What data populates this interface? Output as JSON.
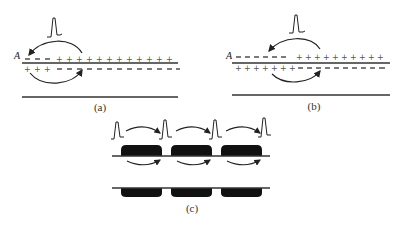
{
  "panels": {
    "a": {
      "caption": "(a)",
      "point_label": "A",
      "upper_charges": {
        "left": "– – –",
        "right": "+ + + + + + + + + + + + +"
      },
      "lower_charges": {
        "left": "+ + +",
        "right": "– – – – – – – – – – – –"
      }
    },
    "b": {
      "caption": "(b)",
      "point_label": "A",
      "upper_charges": {
        "left": "– – – – – –",
        "right": "+ + + + + + + + + +"
      },
      "lower_charges": {
        "left": "+ + + + + + +",
        "right": "– – – – – – – – –"
      }
    },
    "c": {
      "caption": "(c)",
      "myelin_segments": 3,
      "action_potentials": 4
    }
  },
  "colors": {
    "line": "#222222",
    "myelin": "#111111",
    "background": "#ffffff"
  }
}
